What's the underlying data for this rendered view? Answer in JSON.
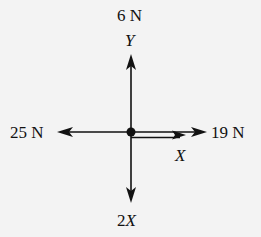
{
  "diagram": {
    "type": "free-body-diagram",
    "background_color": "#f3f3f3",
    "ink_color": "#111111",
    "center_point": {
      "x": 131,
      "y": 132
    },
    "forces": {
      "up": {
        "magnitude_label": "6 N",
        "axis_label": "Y",
        "direction": "up"
      },
      "left": {
        "magnitude_label": "25 N",
        "direction": "left"
      },
      "right": {
        "magnitude_label": "19 N",
        "direction": "right"
      },
      "right_unknown": {
        "axis_label": "X",
        "direction": "right",
        "style": "double-line"
      },
      "down": {
        "coefficient": "2",
        "variable": "X",
        "direction": "down"
      }
    }
  }
}
